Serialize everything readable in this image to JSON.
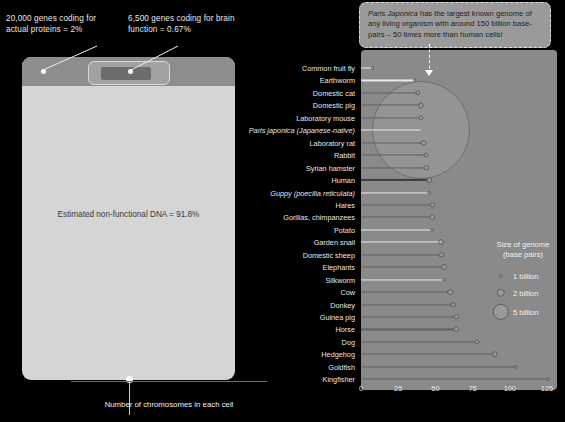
{
  "left_panel": {
    "note_proteins": "20,000 genes coding for actual proteins = 2%",
    "note_brain": "6,500 genes coding for brain function = 0.67%",
    "body_label": "Estimated non-functional DNA = 91.8%"
  },
  "callout": {
    "species": "Paris Japonica",
    "text": " has the largest known genome of any living organism with around 150 billion base-pairs – 50 times more than human cells!"
  },
  "legend": {
    "title_line1": "Size of genome",
    "title_line2": "(base pairs)",
    "items": [
      {
        "label": "1 billion",
        "value": 1
      },
      {
        "label": "2 billion",
        "value": 2
      },
      {
        "label": "5 billion",
        "value": 5
      }
    ]
  },
  "chart_data": {
    "type": "scatter",
    "title": "",
    "xlabel": "Number of chromosomes in each cell",
    "ylabel": "",
    "xlim": [
      0,
      125
    ],
    "xticks": [
      0,
      25,
      50,
      75,
      100,
      125
    ],
    "grid": false,
    "legend_position": "right",
    "bubble_size_unit": "genome size in billions of base pairs",
    "categories": [
      "Common fruit fly",
      "Earthworm",
      "Domestic cat",
      "Domestic pig",
      "Laboratory mouse",
      "Paris japonica (Japanese-native)",
      "Laboratory rat",
      "Rabbit",
      "Syrian hamster",
      "Human",
      "Guppy (poecilia reticulata)",
      "Hares",
      "Gorillas, chimpanzees",
      "Potato",
      "Garden snail",
      "Domestic sheep",
      "Elephants",
      "Silkworm",
      "Cow",
      "Donkey",
      "Guinea pig",
      "Horse",
      "Dog",
      "Hedgehog",
      "Goldfish",
      "Kingfisher"
    ],
    "points": [
      {
        "name": "Common fruit fly",
        "chromosomes": 8,
        "genome": 0.14
      },
      {
        "name": "Earthworm",
        "chromosomes": 36,
        "genome": 0.2
      },
      {
        "name": "Domestic cat",
        "chromosomes": 38,
        "genome": 2.6
      },
      {
        "name": "Domestic pig",
        "chromosomes": 40,
        "genome": 2.5
      },
      {
        "name": "Laboratory mouse",
        "chromosomes": 40,
        "genome": 2.7
      },
      {
        "name": "Paris japonica (Japanese-native)",
        "chromosomes": 40,
        "genome": 150
      },
      {
        "name": "Laboratory rat",
        "chromosomes": 42,
        "genome": 2.4
      },
      {
        "name": "Rabbit",
        "chromosomes": 44,
        "genome": 2.2
      },
      {
        "name": "Syrian hamster",
        "chromosomes": 44,
        "genome": 2.6
      },
      {
        "name": "Human",
        "chromosomes": 46,
        "genome": 3.1
      },
      {
        "name": "Guppy (poecilia reticulata)",
        "chromosomes": 46,
        "genome": 0.7
      },
      {
        "name": "Hares",
        "chromosomes": 48,
        "genome": 2.6
      },
      {
        "name": "Gorillas, chimpanzees",
        "chromosomes": 48,
        "genome": 3.0
      },
      {
        "name": "Potato",
        "chromosomes": 48,
        "genome": 0.85
      },
      {
        "name": "Garden snail",
        "chromosomes": 54,
        "genome": 3.2
      },
      {
        "name": "Domestic sheep",
        "chromosomes": 54,
        "genome": 2.6
      },
      {
        "name": "Elephants",
        "chromosomes": 56,
        "genome": 3.5
      },
      {
        "name": "Silkworm",
        "chromosomes": 56,
        "genome": 0.43
      },
      {
        "name": "Cow",
        "chromosomes": 60,
        "genome": 2.9
      },
      {
        "name": "Donkey",
        "chromosomes": 62,
        "genome": 3.0
      },
      {
        "name": "Guinea pig",
        "chromosomes": 64,
        "genome": 2.7
      },
      {
        "name": "Horse",
        "chromosomes": 64,
        "genome": 3.2
      },
      {
        "name": "Dog",
        "chromosomes": 78,
        "genome": 2.4
      },
      {
        "name": "Hedgehog",
        "chromosomes": 90,
        "genome": 2.8
      },
      {
        "name": "Goldfish",
        "chromosomes": 104,
        "genome": 1.8
      },
      {
        "name": "Kingfisher",
        "chromosomes": 126,
        "genome": 1.3
      }
    ]
  }
}
